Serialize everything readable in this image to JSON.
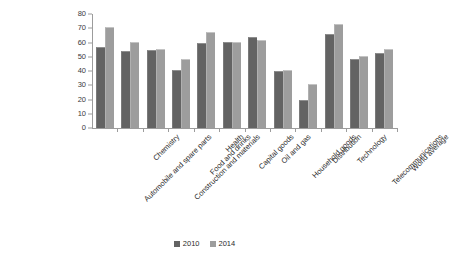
{
  "chart_data": {
    "type": "bar",
    "title": "",
    "xlabel": "",
    "ylabel": "",
    "ylim": [
      0,
      80
    ],
    "ytick_step": 10,
    "yticks": [
      80,
      70,
      60,
      50,
      40,
      30,
      20,
      10,
      0
    ],
    "grid": false,
    "legend_position": "bottom-center",
    "categories": [
      "Automobile and spare parts",
      "Chemistry",
      "Construction and materials",
      "Food and drinks",
      "Health",
      "Capital goods",
      "Oil and gas",
      "Household goods",
      "Distribution",
      "Technology",
      "Telecommunications",
      "World average"
    ],
    "series": [
      {
        "name": "2010",
        "color": "#636363",
        "values": [
          56,
          53,
          54,
          40,
          59,
          60,
          63,
          39,
          19,
          65,
          48,
          52
        ]
      },
      {
        "name": "2014",
        "color": "#9d9d9d",
        "values": [
          70,
          60,
          55,
          48,
          67,
          60,
          61,
          40,
          30,
          72,
          50,
          55
        ]
      }
    ]
  }
}
